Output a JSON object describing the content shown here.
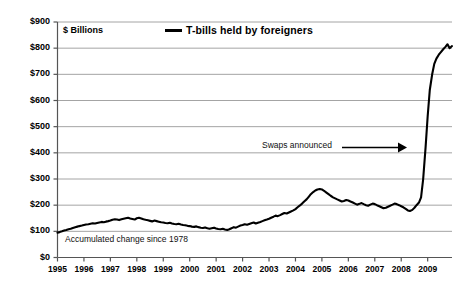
{
  "chart_data": {
    "type": "line",
    "title": "",
    "subtitle": "",
    "xlabel": "",
    "ylabel": "$ Billions",
    "ylim": [
      0,
      900
    ],
    "xlim": [
      1995,
      2009.92
    ],
    "grid": true,
    "legend_position": "top-center",
    "y_ticks": [
      "$0",
      "$100",
      "$200",
      "$300",
      "$400",
      "$500",
      "$600",
      "$700",
      "$800",
      "$900"
    ],
    "y_tick_values": [
      0,
      100,
      200,
      300,
      400,
      500,
      600,
      700,
      800,
      900
    ],
    "x_ticks": [
      "1995",
      "1996",
      "1997",
      "1998",
      "1999",
      "2000",
      "2001",
      "2002",
      "2003",
      "2004",
      "2005",
      "2006",
      "2007",
      "2008",
      "2009"
    ],
    "x_tick_values": [
      1995,
      1996,
      1997,
      1998,
      1999,
      2000,
      2001,
      2002,
      2003,
      2004,
      2005,
      2006,
      2007,
      2008,
      2009
    ],
    "series": [
      {
        "name": "T-bills held by foreigners",
        "color": "#000000",
        "x": [
          1995.0,
          1995.08,
          1995.17,
          1995.25,
          1995.33,
          1995.42,
          1995.5,
          1995.58,
          1995.67,
          1995.75,
          1995.83,
          1995.92,
          1996.0,
          1996.08,
          1996.17,
          1996.25,
          1996.33,
          1996.42,
          1996.5,
          1996.58,
          1996.67,
          1996.75,
          1996.83,
          1996.92,
          1997.0,
          1997.08,
          1997.17,
          1997.25,
          1997.33,
          1997.42,
          1997.5,
          1997.58,
          1997.67,
          1997.75,
          1997.83,
          1997.92,
          1998.0,
          1998.08,
          1998.17,
          1998.25,
          1998.33,
          1998.42,
          1998.5,
          1998.58,
          1998.67,
          1998.75,
          1998.83,
          1998.92,
          1999.0,
          1999.08,
          1999.17,
          1999.25,
          1999.33,
          1999.42,
          1999.5,
          1999.58,
          1999.67,
          1999.75,
          1999.83,
          1999.92,
          2000.0,
          2000.08,
          2000.17,
          2000.25,
          2000.33,
          2000.42,
          2000.5,
          2000.58,
          2000.67,
          2000.75,
          2000.83,
          2000.92,
          2001.0,
          2001.08,
          2001.17,
          2001.25,
          2001.33,
          2001.42,
          2001.5,
          2001.58,
          2001.67,
          2001.75,
          2001.83,
          2001.92,
          2002.0,
          2002.08,
          2002.17,
          2002.25,
          2002.33,
          2002.42,
          2002.5,
          2002.58,
          2002.67,
          2002.75,
          2002.83,
          2002.92,
          2003.0,
          2003.08,
          2003.17,
          2003.25,
          2003.33,
          2003.42,
          2003.5,
          2003.58,
          2003.67,
          2003.75,
          2003.83,
          2003.92,
          2004.0,
          2004.08,
          2004.17,
          2004.25,
          2004.33,
          2004.42,
          2004.5,
          2004.58,
          2004.67,
          2004.75,
          2004.83,
          2004.92,
          2005.0,
          2005.08,
          2005.17,
          2005.25,
          2005.33,
          2005.42,
          2005.5,
          2005.58,
          2005.67,
          2005.75,
          2005.83,
          2005.92,
          2006.0,
          2006.08,
          2006.17,
          2006.25,
          2006.33,
          2006.42,
          2006.5,
          2006.58,
          2006.67,
          2006.75,
          2006.83,
          2006.92,
          2007.0,
          2007.08,
          2007.17,
          2007.25,
          2007.33,
          2007.42,
          2007.5,
          2007.58,
          2007.67,
          2007.75,
          2007.83,
          2007.92,
          2008.0,
          2008.08,
          2008.17,
          2008.25,
          2008.33,
          2008.42,
          2008.5,
          2008.58,
          2008.67,
          2008.75,
          2008.83,
          2008.92,
          2009.0,
          2009.08,
          2009.17,
          2009.25,
          2009.33,
          2009.42,
          2009.5,
          2009.58,
          2009.67,
          2009.75,
          2009.83,
          2009.92
        ],
        "y": [
          95,
          97,
          100,
          103,
          105,
          108,
          110,
          113,
          116,
          118,
          120,
          122,
          124,
          126,
          127,
          129,
          131,
          130,
          132,
          134,
          136,
          135,
          137,
          139,
          141,
          144,
          146,
          145,
          143,
          146,
          148,
          150,
          152,
          149,
          147,
          145,
          150,
          152,
          149,
          146,
          144,
          142,
          140,
          138,
          141,
          139,
          137,
          135,
          134,
          132,
          131,
          133,
          130,
          128,
          127,
          129,
          126,
          124,
          123,
          121,
          120,
          118,
          117,
          119,
          116,
          114,
          113,
          115,
          112,
          110,
          112,
          114,
          111,
          109,
          108,
          110,
          107,
          105,
          108,
          112,
          116,
          114,
          118,
          122,
          124,
          127,
          125,
          128,
          131,
          134,
          130,
          133,
          136,
          139,
          142,
          145,
          148,
          152,
          156,
          160,
          158,
          162,
          166,
          170,
          168,
          172,
          176,
          180,
          185,
          192,
          199,
          206,
          214,
          222,
          232,
          242,
          250,
          256,
          260,
          262,
          260,
          255,
          248,
          242,
          236,
          230,
          226,
          222,
          218,
          214,
          216,
          220,
          218,
          214,
          210,
          206,
          202,
          205,
          208,
          204,
          200,
          198,
          202,
          206,
          204,
          200,
          196,
          192,
          188,
          190,
          194,
          198,
          202,
          206,
          204,
          200,
          196,
          192,
          186,
          180,
          178,
          182,
          190,
          200,
          210,
          230,
          300,
          420,
          540,
          640,
          700,
          740,
          760,
          775,
          785,
          795,
          805,
          815,
          800,
          808
        ]
      }
    ],
    "annotations": [
      {
        "text": "Swaps announced",
        "x": 2007.6,
        "y": 400,
        "arrow": "right",
        "arrow_target_x": 2008.95
      },
      {
        "text": "Accumulated change since 1978",
        "x": 1995.3,
        "y": 42
      }
    ]
  },
  "legend": {
    "entries": [
      {
        "label": "T-bills held by foreigners",
        "marker": "line-dash",
        "color": "#000000"
      }
    ]
  },
  "labels": {
    "units": "$ Billions",
    "note_accumulated": "Accumulated change since 1978",
    "annotation_swaps": "Swaps announced"
  }
}
